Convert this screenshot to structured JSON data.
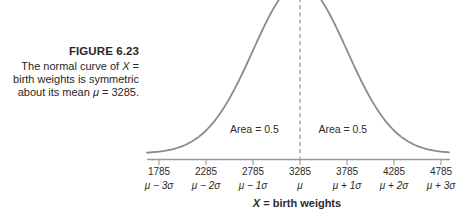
{
  "caption": {
    "title": "FIGURE 6.23",
    "lines": [
      [
        {
          "t": "The normal curve of ",
          "i": 0
        },
        {
          "t": "X",
          "i": 1
        },
        {
          "t": " =",
          "i": 0
        }
      ],
      [
        {
          "t": "birth weights is symmetric",
          "i": 0
        }
      ],
      [
        {
          "t": "about its mean ",
          "i": 0
        },
        {
          "t": "μ",
          "i": 1
        },
        {
          "t": " = 3285.",
          "i": 0
        }
      ]
    ]
  },
  "chart_data": {
    "type": "area",
    "curve": "normal-distribution-pdf",
    "mean": 3285,
    "sd": 500,
    "peak_cropped_at_top": true,
    "xlabel": "X = birth weights",
    "xlabel_segments": [
      {
        "t": "X",
        "i": 1
      },
      {
        "t": " = birth weights",
        "i": 0
      }
    ],
    "x_ticks": [
      "1785",
      "2285",
      "2785",
      "3285",
      "3785",
      "4285",
      "4785"
    ],
    "x_tick_values": [
      1785,
      2285,
      2785,
      3285,
      3785,
      4285,
      4785
    ],
    "x_tick_sublabels": [
      "μ − 3σ",
      "μ − 2σ",
      "μ − 1σ",
      "μ",
      "μ + 1σ",
      "μ + 2σ",
      "μ + 3σ"
    ],
    "xlim": [
      1660,
      4880
    ],
    "grid": false,
    "legend": "none",
    "mean_line": {
      "style": "dashed",
      "x": 3285
    },
    "annotations": [
      {
        "text": "Area = 0.5",
        "x": 2800
      },
      {
        "text": "Area = 0.5",
        "x": 3740
      }
    ]
  },
  "colors": {
    "curve": "#8b8b8b",
    "axis": "#9a9a9a",
    "dashed_line": "#9a9a9a",
    "text": "#2b2b2b",
    "background": "#ffffff"
  }
}
